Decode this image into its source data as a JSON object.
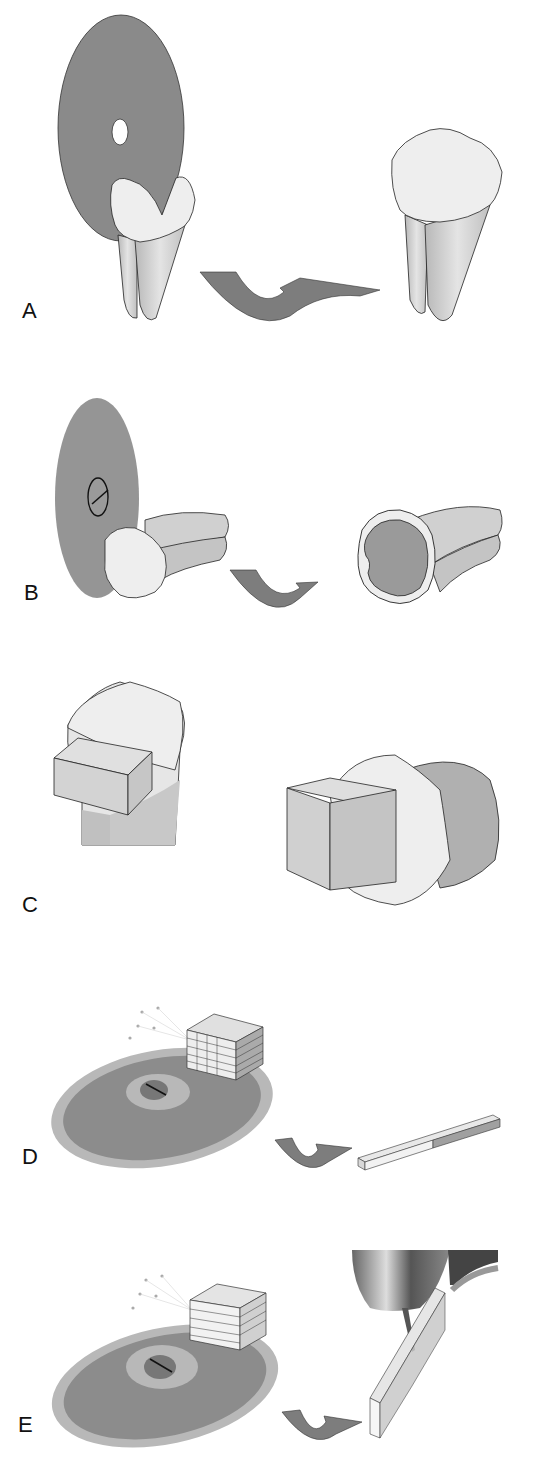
{
  "figure": {
    "panels": [
      {
        "id": "A",
        "label": "A",
        "description": "Diamond disc sectioning molar crown horizontally; resulting sectioned tooth"
      },
      {
        "id": "B",
        "label": "B",
        "description": "Disc sectioning tooth crown transversely; resulting cross-section showing enamel and dentin"
      },
      {
        "id": "C",
        "label": "C",
        "description": "Rectangular block cut from crown; enlarged block embedded in crown"
      },
      {
        "id": "D",
        "label": "D",
        "description": "Block sliced into sticks on rotating disc; resulting beam specimen"
      },
      {
        "id": "E",
        "label": "E",
        "description": "Block sliced into slabs on rotating disc; slab specimen under testing tip"
      }
    ]
  },
  "colors": {
    "disc": "#8a8a8a",
    "disc_rim": "#b5b5b5",
    "enamel": "#eeeeee",
    "root": "#c8c8c8",
    "dentin": "#9a9a9a",
    "arrow": "#7d7d7d",
    "block": "#d6d6d6",
    "outline": "#222222"
  }
}
